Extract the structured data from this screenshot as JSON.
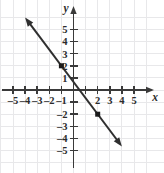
{
  "chart_data": {
    "type": "line",
    "title": "",
    "xlabel": "x",
    "ylabel": "y",
    "xlim": [
      -6,
      6
    ],
    "ylim": [
      -6,
      6
    ],
    "grid": true,
    "legend": null,
    "x_ticks": [
      -5,
      -4,
      -3,
      -2,
      -1,
      2,
      3,
      4,
      5
    ],
    "x_tick_labels": [
      "–5",
      "–4",
      "–3",
      "–2",
      "–1",
      "2",
      "3",
      "4",
      "5"
    ],
    "y_ticks": [
      5,
      4,
      3,
      2,
      1,
      -2,
      -3,
      -4,
      -5
    ],
    "y_tick_labels": [
      "5",
      "4",
      "3",
      "2",
      "1",
      "–2",
      "–3",
      "–4",
      "–5"
    ],
    "series": [
      {
        "name": "line",
        "slope": -1.3333,
        "intercept": 0.6667,
        "x_endpoints": [
          -4.0,
          4.0
        ],
        "arrows": [
          "start",
          "end"
        ],
        "color": "#2f2f2f",
        "points": [
          {
            "label": "(–1, 2)",
            "x": -1,
            "y": 2
          },
          {
            "label": "(2, –2)",
            "x": 2,
            "y": -2
          }
        ]
      }
    ]
  },
  "axes": {
    "x_axis_label": "x",
    "y_axis_label": "y"
  },
  "style": {
    "grid_color": "#e8e8ea",
    "axis_color": "#3a3a3a",
    "line_color": "#2f2f2f",
    "marker_color": "#1a1a1a",
    "label_color": "#2b2b2b",
    "background": "#ffffff"
  }
}
